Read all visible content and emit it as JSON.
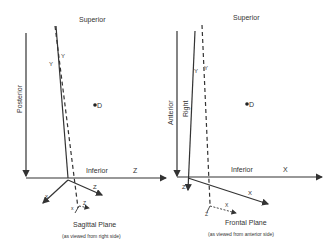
{
  "left_panel": {
    "superior": "Superior",
    "posterior": "Posterior",
    "inferior": "Inferior",
    "z_axis": "Z",
    "y_solid": "Y",
    "y_dashed": "Y",
    "point": "D",
    "x_small": "x",
    "z_small": "Z",
    "x_tiny": "x",
    "z_tiny": "Z",
    "title": "Sagittal Plane",
    "subtitle": "(as viewed from right side)"
  },
  "right_panel": {
    "superior": "Superior",
    "anterior": "Anterior",
    "right": "Right",
    "inferior": "Inferior",
    "x_axis": "X",
    "y_solid": "Y",
    "y_dashed": "Y",
    "point": "D",
    "z_small": "Z",
    "x_small": "X",
    "z_tiny": "Z",
    "x_tiny": "X",
    "title": "Frontal Plane",
    "subtitle": "(as viewed from anterior side)"
  }
}
